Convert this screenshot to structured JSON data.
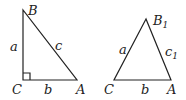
{
  "diagram": {
    "left_triangle": {
      "type": "right-triangle",
      "vertices": {
        "B": "B",
        "C": "C",
        "A": "A"
      },
      "sides": {
        "a": "a",
        "b": "b",
        "c": "c"
      },
      "right_angle_at": "C"
    },
    "right_triangle": {
      "type": "triangle",
      "vertices": {
        "B1": "B",
        "B1_sub": "1",
        "C": "C",
        "A": "A"
      },
      "sides": {
        "a": "a",
        "b": "b",
        "c1": "c",
        "c1_sub": "1"
      }
    },
    "colors": {
      "stroke": "#222222",
      "background": "#ffffff"
    }
  }
}
